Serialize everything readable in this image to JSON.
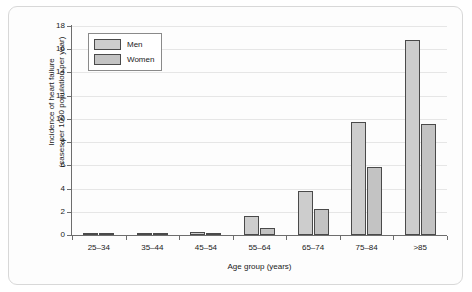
{
  "chart_data": {
    "type": "bar",
    "title": "",
    "subtitle": "",
    "xlabel": "Age group (years)",
    "ylabel_line1": "Incidence of heart failure",
    "ylabel_line2": "(cases per 1000 population per year)",
    "categories": [
      "25–34",
      "35–44",
      "45–54",
      "55–64",
      "65–74",
      "75–84",
      ">85"
    ],
    "series": [
      {
        "name": "Men",
        "values": [
          0.1,
          0.15,
          0.3,
          1.6,
          3.8,
          9.7,
          16.8
        ]
      },
      {
        "name": "Women",
        "values": [
          0.05,
          0.1,
          0.1,
          0.6,
          2.2,
          5.9,
          9.6
        ]
      }
    ],
    "ylim": [
      0,
      18
    ],
    "yticks": [
      0,
      2,
      4,
      6,
      8,
      10,
      12,
      14,
      16,
      18
    ],
    "ytick_labels": [
      "0",
      "2",
      "4",
      "6",
      "8",
      "10",
      "12",
      "14",
      "16",
      "18"
    ],
    "grid": true,
    "grid_axis": "y",
    "legend_position": "top-left",
    "colors": {
      "men_fill": "#cdcdcd",
      "women_fill": "#c3c3c3",
      "bar_outline": "#4a4a4a",
      "axis": "#6d6d6d",
      "gridline": "#e6e6e6",
      "background": "#fdfdfd",
      "frame_border": "#d8d8d8",
      "text": "#1a1a1a"
    }
  }
}
